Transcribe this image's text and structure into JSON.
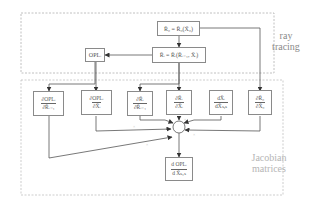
{
  "regions": {
    "ray_tracing": {
      "label_line1": "ray",
      "label_line2": "tracing"
    },
    "jacobian": {
      "label_line1": "Jacobian",
      "label_line2": "matrices"
    }
  },
  "nodes": {
    "r0": {
      "text": "R̄₀ = R̄₀(X̄₀)"
    },
    "ri": {
      "text": "R̄ᵢ = R̄ᵢ(R̄ᵢ₋₁, X̄ᵢ)"
    },
    "opl": {
      "text": "OPLᵢ"
    },
    "d_opl_d_r": {
      "num": "∂OPLᵢ",
      "den": "∂R̄ᵢ₋₁"
    },
    "d_opl_d_x": {
      "num": "∂OPLᵢ",
      "den": "∂X̄ᵢ"
    },
    "d_r_d_rprev": {
      "num": "∂R̄ᵢ",
      "den": "∂R̄ᵢ₋₁"
    },
    "d_r_d_x": {
      "num": "∂R̄ᵢ",
      "den": "∂X̄ᵢ"
    },
    "dx_dxsys": {
      "num": "dX̄ᵢ",
      "den": "dX̄ₛᵧₛ"
    },
    "d_r0_d_x0": {
      "num": "∂R̄₀",
      "den": "∂X̄₀"
    },
    "result": {
      "num": "d OPLᵢ",
      "den": "d X̄ₛᵧₛ"
    }
  },
  "marks": {
    "multiply": "×"
  },
  "colors": {
    "line": "#555555",
    "box_border": "#8a8a8a",
    "dash": "#b0b0b0"
  }
}
